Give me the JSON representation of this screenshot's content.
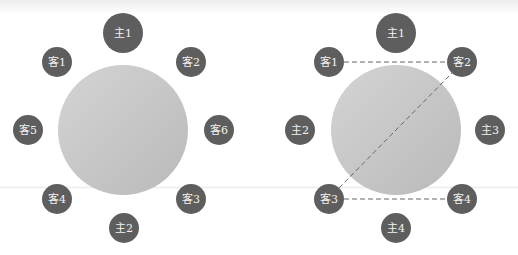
{
  "colors": {
    "seat": "#5e5e5e",
    "table_light": "#d4d4d4",
    "table_dark": "#b9b9b9",
    "dash": "#666666",
    "label": "#f2f2f2"
  },
  "diagrams": [
    {
      "name": "left-seating",
      "table": {
        "cx": 123,
        "cy": 130,
        "r": 65
      },
      "seats": [
        {
          "label": "主1",
          "cx": 123,
          "cy": 33,
          "r": 20
        },
        {
          "label": "客1",
          "cx": 57,
          "cy": 62,
          "r": 15
        },
        {
          "label": "客2",
          "cx": 191,
          "cy": 62,
          "r": 15
        },
        {
          "label": "客5",
          "cx": 28,
          "cy": 130,
          "r": 15
        },
        {
          "label": "客6",
          "cx": 219,
          "cy": 130,
          "r": 15
        },
        {
          "label": "客4",
          "cx": 57,
          "cy": 199,
          "r": 15
        },
        {
          "label": "客3",
          "cx": 191,
          "cy": 199,
          "r": 15
        },
        {
          "label": "主2",
          "cx": 124,
          "cy": 228,
          "r": 15
        }
      ],
      "lines": []
    },
    {
      "name": "right-seating",
      "table": {
        "cx": 396,
        "cy": 130,
        "r": 65
      },
      "seats": [
        {
          "label": "主1",
          "cx": 396,
          "cy": 33,
          "r": 20
        },
        {
          "label": "客1",
          "cx": 329,
          "cy": 62,
          "r": 15
        },
        {
          "label": "客2",
          "cx": 462,
          "cy": 62,
          "r": 15
        },
        {
          "label": "主2",
          "cx": 300,
          "cy": 130,
          "r": 15
        },
        {
          "label": "主3",
          "cx": 490,
          "cy": 130,
          "r": 15
        },
        {
          "label": "客3",
          "cx": 329,
          "cy": 199,
          "r": 15
        },
        {
          "label": "客4",
          "cx": 462,
          "cy": 199,
          "r": 15
        },
        {
          "label": "主4",
          "cx": 396,
          "cy": 228,
          "r": 15
        }
      ],
      "lines": [
        {
          "from": "客1",
          "to": "客2",
          "x1": 344,
          "y1": 62,
          "x2": 447,
          "y2": 62
        },
        {
          "from": "客3",
          "to": "客4",
          "x1": 344,
          "y1": 199,
          "x2": 447,
          "y2": 199
        },
        {
          "from": "客3",
          "to": "客2",
          "x1": 339,
          "y1": 188,
          "x2": 452,
          "y2": 73
        }
      ]
    }
  ]
}
